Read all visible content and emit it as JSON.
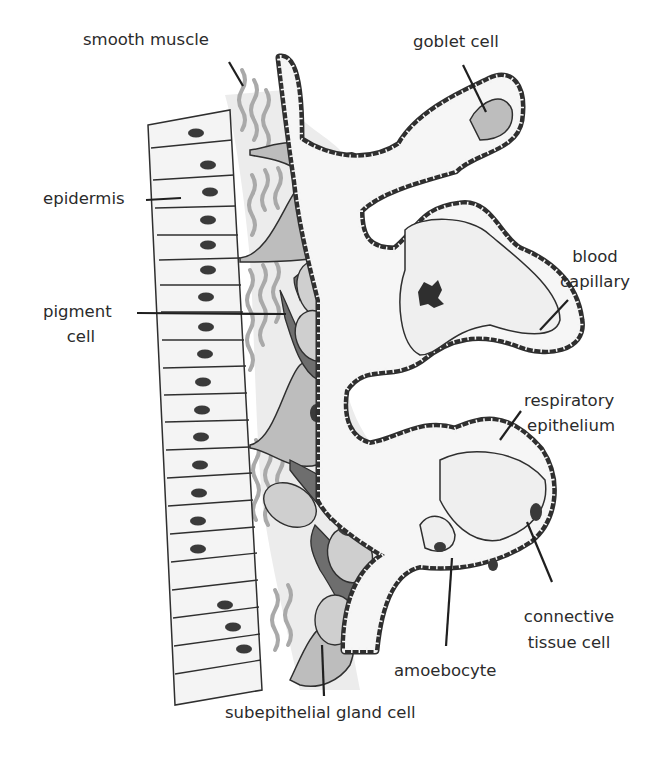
{
  "diagram": {
    "colors": {
      "outline": "#2f2f2f",
      "epidermis_fill": "#f4f4f4",
      "connective_fill": "#ececec",
      "muscle_fibers": "#a9a9a9",
      "gland_fill": "#bdbdbd",
      "pigment_fill": "#6e6e6e",
      "nucleus": "#3a3a3a",
      "capillary_fill": "#efefef"
    },
    "labels": {
      "smooth_muscle": "smooth muscle",
      "goblet_cell": "goblet cell",
      "epidermis": "epidermis",
      "blood_capillary_1": "blood",
      "blood_capillary_2": "capillary",
      "pigment_cell_1": "pigment",
      "pigment_cell_2": "cell",
      "respiratory_epithelium_1": "respiratory",
      "respiratory_epithelium_2": "epithelium",
      "connective_tissue_cell_1": "connective",
      "connective_tissue_cell_2": "tissue cell",
      "amoebocyte": "amoebocyte",
      "subepithelial_gland_cell": "subepithelial gland cell"
    }
  }
}
